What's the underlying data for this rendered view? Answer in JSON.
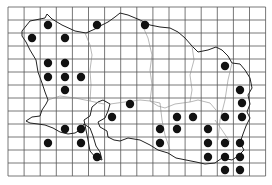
{
  "map": {
    "title": "Distribution grid map (island, 1-km squares)",
    "grid": {
      "x0": 8,
      "y0": 7,
      "cols": 16,
      "rows": 13,
      "cell_w": 16.1,
      "cell_h": 13
    },
    "colors": {
      "grid": "#555555",
      "coast": "#222222",
      "boundary": "#888888",
      "dot": "#111111",
      "background": "#ffffff"
    },
    "dots": [
      [
        48,
        25
      ],
      [
        97,
        25
      ],
      [
        145,
        25
      ],
      [
        32,
        38
      ],
      [
        65,
        38
      ],
      [
        48,
        63
      ],
      [
        65,
        63
      ],
      [
        48,
        77
      ],
      [
        65,
        77
      ],
      [
        81,
        77
      ],
      [
        65,
        90
      ],
      [
        225,
        66
      ],
      [
        240,
        90
      ],
      [
        242,
        103
      ],
      [
        242,
        117
      ],
      [
        130,
        104
      ],
      [
        112,
        117
      ],
      [
        177,
        117
      ],
      [
        193,
        117
      ],
      [
        225,
        117
      ],
      [
        65,
        129
      ],
      [
        81,
        129
      ],
      [
        160,
        129
      ],
      [
        177,
        129
      ],
      [
        208,
        129
      ],
      [
        48,
        143
      ],
      [
        81,
        143
      ],
      [
        160,
        143
      ],
      [
        208,
        143
      ],
      [
        225,
        143
      ],
      [
        240,
        143
      ],
      [
        97,
        157
      ],
      [
        208,
        157
      ],
      [
        225,
        157
      ],
      [
        240,
        157
      ],
      [
        225,
        170
      ],
      [
        240,
        170
      ]
    ]
  }
}
